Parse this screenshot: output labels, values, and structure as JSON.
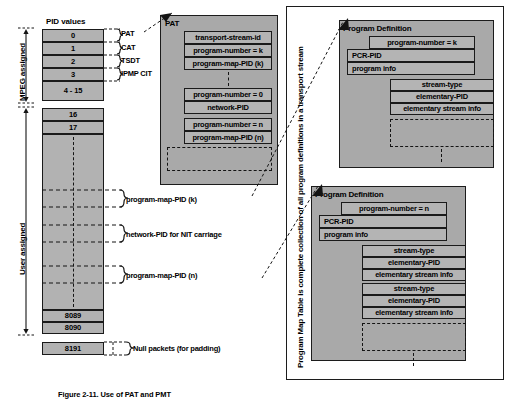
{
  "figure": {
    "caption": "Figure 2-11. Use of PAT and PMT",
    "vertical_note": "Program Map Table is complete collection of all program definitions in a transport stream"
  },
  "pid_table": {
    "header": "PID values",
    "brackets": [
      {
        "label": "MPEG assigned"
      },
      {
        "label": "User assigned"
      }
    ],
    "rows": [
      {
        "value": "0"
      },
      {
        "value": "1"
      },
      {
        "value": "2"
      },
      {
        "value": "3"
      },
      {
        "value": "4 - 15"
      },
      {
        "value": "16"
      },
      {
        "value": "17"
      },
      {
        "value": "8089"
      },
      {
        "value": "8090"
      },
      {
        "value": "8191"
      }
    ],
    "annotations": [
      {
        "label": "PAT"
      },
      {
        "label": "CAT"
      },
      {
        "label": "TSDT"
      },
      {
        "label": "IPMP CIT"
      },
      {
        "label": "program-map-PID (k)"
      },
      {
        "label": "network-PID for NIT carriage"
      },
      {
        "label": "program-map-PID (n)"
      },
      {
        "label": "Null packets (for padding)"
      }
    ]
  },
  "pat": {
    "title": "PAT",
    "fields": [
      {
        "text": "transport-stream-id"
      },
      {
        "text": "program-number = k"
      },
      {
        "text": "program-map-PID (k)"
      },
      {
        "text": "program-number = 0"
      },
      {
        "text": "network-PID"
      },
      {
        "text": "program-number = n"
      },
      {
        "text": "program-map-PID (n)"
      }
    ]
  },
  "program_definitions": [
    {
      "title": "Program Definition",
      "fields": [
        {
          "text": "program-number = k"
        },
        {
          "text": "PCR-PID"
        },
        {
          "text": "program info"
        }
      ],
      "streams": [
        {
          "rows": [
            {
              "text": "stream-type"
            },
            {
              "text": "elementary-PID"
            },
            {
              "text": "elementary stream info"
            }
          ]
        }
      ]
    },
    {
      "title": "Program Definition",
      "fields": [
        {
          "text": "program-number = n"
        },
        {
          "text": "PCR-PID"
        },
        {
          "text": "program info"
        }
      ],
      "streams": [
        {
          "rows": [
            {
              "text": "stream-type"
            },
            {
              "text": "elementary-PID"
            },
            {
              "text": "elementary stream info"
            }
          ]
        },
        {
          "rows": [
            {
              "text": "stream-type"
            },
            {
              "text": "elementary-PID"
            },
            {
              "text": "elementary stream info"
            }
          ]
        }
      ]
    }
  ],
  "colors": {
    "panel_fill": "#a9a9a9",
    "cell_fill": "#b2b2b2",
    "stroke": "#1a1a1a",
    "page_bg": "#ffffff"
  }
}
